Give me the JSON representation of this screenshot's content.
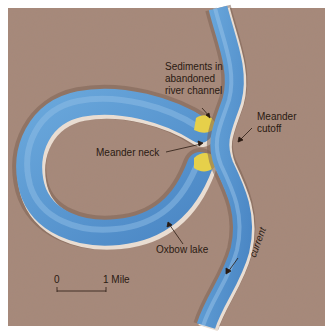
{
  "figure": {
    "colors": {
      "land": "#a7897a",
      "land_dark": "#8f7163",
      "water": "#5f9fd6",
      "water_dark": "#3f78b8",
      "water_highlight": "#9fc8ea",
      "bank_highlight": "#e9ddd2",
      "sediment": "#e6d04a",
      "label_text": "#2a1a12"
    }
  },
  "labels": {
    "sediments": [
      "Sediments in",
      "abandoned",
      "river channel"
    ],
    "meander_cutoff": [
      "Meander",
      "cutoff"
    ],
    "meander_neck": "Meander neck",
    "oxbow_lake": "Oxbow lake",
    "current": "current"
  },
  "scale_bar": {
    "start_label": "0",
    "end_label": "1 Mile"
  }
}
